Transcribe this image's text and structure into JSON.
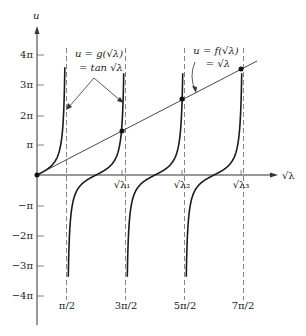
{
  "figure": {
    "axes": {
      "x_label": "√λ",
      "y_label": "u",
      "y_ticks": [
        {
          "label": "4π",
          "value": 4
        },
        {
          "label": "3π",
          "value": 3
        },
        {
          "label": "2π",
          "value": 2
        },
        {
          "label": "π",
          "value": 1
        },
        {
          "label": "−π",
          "value": -1
        },
        {
          "label": "−2π",
          "value": -2
        },
        {
          "label": "−3π",
          "value": -3
        },
        {
          "label": "−4π",
          "value": -4
        }
      ],
      "asymptote_labels": [
        {
          "label": "π/2",
          "value": 0.5
        },
        {
          "label": "3π/2",
          "value": 1.5
        },
        {
          "label": "5π/2",
          "value": 2.5
        },
        {
          "label": "7π/2",
          "value": 3.5
        }
      ],
      "eigen_labels": [
        {
          "label": "√λ₁"
        },
        {
          "label": "√λ₂"
        },
        {
          "label": "√λ₃"
        }
      ]
    },
    "annotations": {
      "g_line1": "u = g(√λ)",
      "g_line2": "= tan √λ",
      "f_line1": "u = f(√λ)",
      "f_line2": "= √λ"
    },
    "colors": {
      "curve": "#1a1a1a",
      "asymptote": "#666666",
      "background": "#ffffff"
    }
  }
}
